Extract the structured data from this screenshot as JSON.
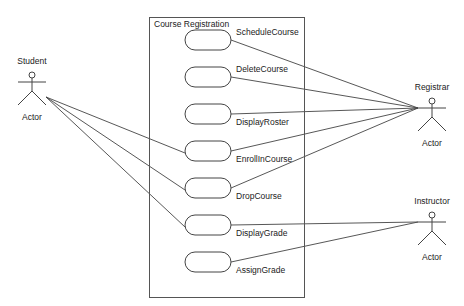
{
  "diagram": {
    "type": "uml-use-case",
    "system": {
      "label": "Course Registration",
      "box": {
        "x": 149,
        "y": 17,
        "w": 155,
        "h": 280
      }
    },
    "use_cases": [
      {
        "id": "schedule",
        "label": "ScheduleCourse",
        "cx": 208,
        "cy": 40
      },
      {
        "id": "delete",
        "label": "DeleteCourse",
        "cx": 208,
        "cy": 77
      },
      {
        "id": "roster",
        "label": "DisplayRoster",
        "cx": 208,
        "cy": 114
      },
      {
        "id": "enroll",
        "label": "EnrollInCourse",
        "cx": 208,
        "cy": 151
      },
      {
        "id": "drop",
        "label": "DropCourse",
        "cx": 208,
        "cy": 188
      },
      {
        "id": "displaygrade",
        "label": "DisplayGrade",
        "cx": 208,
        "cy": 225
      },
      {
        "id": "assigngrade",
        "label": "AssignGrade",
        "cx": 208,
        "cy": 262
      }
    ],
    "actors": [
      {
        "id": "student",
        "name": "Student",
        "stereotype": "Actor",
        "x": 32,
        "y": 72
      },
      {
        "id": "registrar",
        "name": "Registrar",
        "stereotype": "Actor",
        "x": 432,
        "y": 98
      },
      {
        "id": "instructor",
        "name": "Instructor",
        "stereotype": "Actor",
        "x": 432,
        "y": 212
      }
    ],
    "associations": [
      {
        "actor": "student",
        "use_case": "enroll"
      },
      {
        "actor": "student",
        "use_case": "drop"
      },
      {
        "actor": "student",
        "use_case": "displaygrade"
      },
      {
        "actor": "registrar",
        "use_case": "schedule"
      },
      {
        "actor": "registrar",
        "use_case": "delete"
      },
      {
        "actor": "registrar",
        "use_case": "roster"
      },
      {
        "actor": "registrar",
        "use_case": "enroll"
      },
      {
        "actor": "registrar",
        "use_case": "drop"
      },
      {
        "actor": "instructor",
        "use_case": "displaygrade"
      },
      {
        "actor": "instructor",
        "use_case": "assigngrade"
      }
    ],
    "colors": {
      "line": "#444444",
      "text": "#222222",
      "background": "#ffffff"
    }
  }
}
